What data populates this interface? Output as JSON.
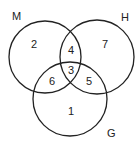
{
  "diagram": {
    "type": "venn",
    "sets": [
      {
        "label": "M",
        "cx": 45,
        "cy": 57,
        "r": 36
      },
      {
        "label": "H",
        "cx": 97,
        "cy": 57,
        "r": 37
      },
      {
        "label": "G",
        "cx": 70,
        "cy": 99,
        "r": 37
      }
    ],
    "regions": [
      {
        "id": "M-only",
        "value": "2",
        "x": 34,
        "y": 48
      },
      {
        "id": "H-only",
        "value": "7",
        "x": 105,
        "y": 48
      },
      {
        "id": "M-H",
        "value": "4",
        "x": 71,
        "y": 54
      },
      {
        "id": "M-H-G",
        "value": "3",
        "x": 71,
        "y": 74
      },
      {
        "id": "M-G",
        "value": "6",
        "x": 52,
        "y": 85
      },
      {
        "id": "H-G",
        "value": "5",
        "x": 90,
        "y": 85
      },
      {
        "id": "G-only",
        "value": "1",
        "x": 71,
        "y": 115
      }
    ],
    "stroke": "#222222"
  }
}
